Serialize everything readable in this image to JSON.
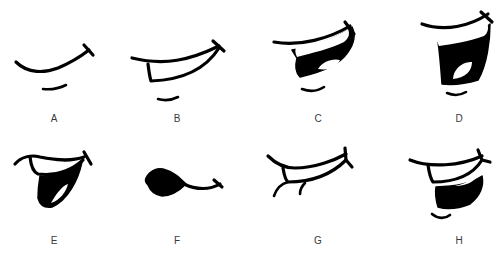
{
  "figure": {
    "background": "#ffffff",
    "line_color": "#000000",
    "label_color": "#3a3a3a",
    "panels": [
      {
        "id": "A",
        "label": "A",
        "shape": "closed-smile-with-chin-line"
      },
      {
        "id": "B",
        "label": "B",
        "shape": "open-smile-teeth-outline-with-chin-line"
      },
      {
        "id": "C",
        "label": "C",
        "shape": "open-mouth-upper-teeth-tongue-with-chin-line"
      },
      {
        "id": "D",
        "label": "D",
        "shape": "wide-open-mouth-upper-teeth-tongue-with-chin-line"
      },
      {
        "id": "E",
        "label": "E",
        "shape": "open-mouth-teeth-tongue-sideways"
      },
      {
        "id": "F",
        "label": "F",
        "shape": "pursed-blob-mouth-with-curl"
      },
      {
        "id": "G",
        "label": "G",
        "shape": "grin-with-teeth-and-lip-strokes"
      },
      {
        "id": "H",
        "label": "H",
        "shape": "smirk-teeth-dark-lower-with-chin-line"
      }
    ]
  }
}
